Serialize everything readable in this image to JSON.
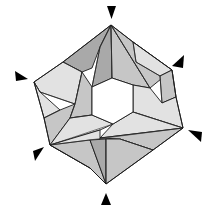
{
  "diagram": {
    "title": "Origami modular polyhedron (hexagonal ring) with fold-point markers",
    "colors": {
      "background": "#ffffff",
      "dark_face": "#a9a9a9",
      "mid_face": "#c6c6c6",
      "light_face": "#e2e2e2",
      "hole": "#ffffff",
      "outline": "#1a1a1a",
      "marker": "#000000"
    },
    "markers": [
      {
        "name": "top",
        "direction": "down",
        "points": "107,6 116,6 111.5,19"
      },
      {
        "name": "upper-right",
        "direction": "down-left",
        "points": "184,55 183,68 172,66"
      },
      {
        "name": "upper-left",
        "direction": "down-right",
        "points": "15,71 28,79 16,81"
      },
      {
        "name": "right",
        "direction": "up-left",
        "points": "188,130 202,132 201,142"
      },
      {
        "name": "lower-left",
        "direction": "up-right",
        "points": "44,147 35,161 33,151"
      },
      {
        "name": "bottom",
        "direction": "up",
        "points": "101,205 111,205 106,193"
      }
    ],
    "faces": [
      {
        "tone": "dark",
        "points": "111,25 63,62 82,72 92,68 100,47"
      },
      {
        "tone": "dark",
        "points": "111,25 100,47 92,87 112,78"
      },
      {
        "tone": "mid",
        "points": "111,25 112,78 133,85 150,88"
      },
      {
        "tone": "mid",
        "points": "111,25 133,42 172,70 150,88"
      },
      {
        "tone": "light",
        "points": "133,42 172,70 160,76 136,62"
      },
      {
        "tone": "mid",
        "points": "160,76 172,70 176,97 162,103"
      },
      {
        "tone": "light",
        "points": "150,88 162,103 176,97 183,128 133,112 133,85"
      },
      {
        "tone": "light",
        "points": "63,62 34,82 40,92 75,104 82,72"
      },
      {
        "tone": "light",
        "points": "34,82 40,92 60,110 44,118"
      },
      {
        "tone": "mid",
        "points": "44,118 60,110 75,104 70,118 50,145"
      },
      {
        "tone": "mid",
        "points": "82,72 92,87 92,115 70,118 75,104"
      },
      {
        "tone": "light",
        "points": "50,145 70,118 92,115 113,124 100,130"
      },
      {
        "tone": "light",
        "points": "113,124 133,112 183,128 100,138"
      },
      {
        "tone": "mid",
        "points": "183,128 153,150 120,139 100,138"
      },
      {
        "tone": "light",
        "points": "50,145 100,130 100,138 90,168"
      },
      {
        "tone": "mid",
        "points": "50,145 90,168 106,184 90,140"
      },
      {
        "tone": "dark",
        "points": "90,140 106,139 106,184"
      },
      {
        "tone": "mid",
        "points": "106,139 120,139 153,150 106,184"
      }
    ],
    "hole": {
      "points": "92,87 112,78 133,85 133,112 113,124 92,115"
    },
    "crease_lines": [
      "111,25 100,47 92,87",
      "111,25 112,78",
      "111,25 150,88",
      "63,62 82,72",
      "133,42 136,62 160,76",
      "172,70 176,97",
      "160,76 162,103",
      "34,82 40,92 75,104",
      "44,118 60,110",
      "50,145 183,128",
      "50,145 113,124",
      "106,139 106,184",
      "120,139 153,150",
      "92,115 70,118",
      "133,112 183,128",
      "82,72 75,104 70,118"
    ],
    "outline": "111,25 133,42 172,70 176,97 183,128 153,150 106,184 90,168 50,145 44,118 34,82 63,62"
  }
}
